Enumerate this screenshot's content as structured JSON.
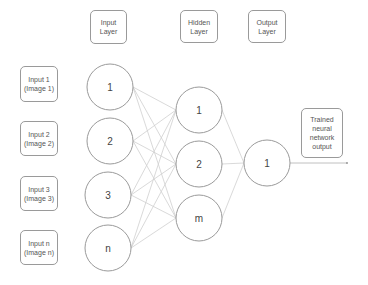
{
  "layer_headers": {
    "input": "Input\nLayer",
    "hidden": "Hidden\nLayer",
    "output": "Output\nLayer"
  },
  "inputs": [
    {
      "label": "Input 1\n(Image 1)"
    },
    {
      "label": "Input 2\n(Image 2)"
    },
    {
      "label": "Input 3\n(Image 3)"
    },
    {
      "label": "Input n\n(Image n)"
    }
  ],
  "input_nodes": [
    "1",
    "2",
    "3",
    "n"
  ],
  "hidden_nodes": [
    "1",
    "2",
    "m"
  ],
  "output_nodes": [
    "1"
  ],
  "output_box": "Trained\nneural\nnetwork\noutput",
  "colors": {
    "stroke": "#9a9a9a",
    "edge": "#c8c8c8"
  }
}
